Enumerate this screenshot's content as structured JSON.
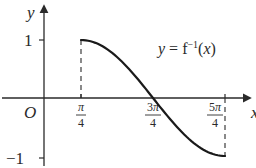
{
  "chart_data": {
    "type": "line",
    "title": "",
    "function_label": "y = f⁻¹(x)",
    "xlabel": "x",
    "ylabel": "y",
    "origin_label": "O",
    "x_ticks": [
      "π/4",
      "3π/4",
      "5π/4"
    ],
    "x_tick_values": [
      0.7854,
      2.3562,
      3.927
    ],
    "y_ticks": [
      "1",
      "−1"
    ],
    "y_tick_values": [
      1,
      -1
    ],
    "xlim": [
      -0.5,
      4.5
    ],
    "ylim": [
      -1.2,
      1.5
    ],
    "grid": false,
    "legend": "none",
    "series": [
      {
        "name": "y = f⁻¹(x)",
        "description": "cosine-shaped decreasing curve on [π/4, 5π/4], equivalent to y = cos(x − π/4)",
        "x": [
          0.7854,
          1.1781,
          1.5708,
          1.9635,
          2.3562,
          2.7489,
          3.1416,
          3.5343,
          3.927
        ],
        "values": [
          1,
          0.924,
          0.707,
          0.383,
          0,
          -0.383,
          -0.707,
          -0.924,
          -1
        ]
      }
    ],
    "annotations": [
      {
        "type": "dashed-vertical",
        "x": 0.7854,
        "from_y": 0,
        "to_y": 1
      },
      {
        "type": "dashed-vertical",
        "x": 3.927,
        "from_y": 0,
        "to_y": -1
      }
    ],
    "colors": {
      "curve": "#1a1a1a",
      "axes": "#2a2a2a",
      "text": "#2a2a2a"
    }
  }
}
